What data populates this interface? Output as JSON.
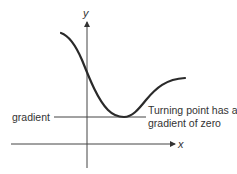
{
  "diagram": {
    "axes": {
      "x_label": "x",
      "y_label": "y"
    },
    "annotations": {
      "left_label": "gradient",
      "right_label_line1": "Turning point has a",
      "right_label_line2": "gradient of zero"
    },
    "colors": {
      "curve": "#2a2a2a",
      "axes": "#444444",
      "text": "#333333"
    }
  }
}
